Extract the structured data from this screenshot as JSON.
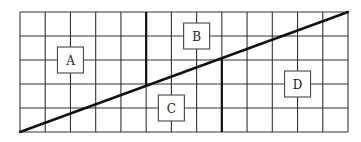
{
  "diagram": {
    "type": "grid-partition",
    "grid": {
      "columns": 13,
      "rows": 5,
      "left": 20,
      "top": 12,
      "right": 348,
      "bottom": 132
    },
    "diagonal": {
      "from": "bottom-left",
      "to": "top-right"
    },
    "thick_segments": [
      {
        "col_line": 5,
        "from": "top",
        "to": "diagonal"
      },
      {
        "col_line": 8,
        "from": "diagonal",
        "to": "bottom"
      }
    ],
    "regions": [
      {
        "id": "A",
        "label": "A",
        "col_line": 2,
        "row_line": 2
      },
      {
        "id": "B",
        "label": "B",
        "col_line": 7,
        "row_line": 1
      },
      {
        "id": "C",
        "label": "C",
        "col_line": 6,
        "row_line": 4
      },
      {
        "id": "D",
        "label": "D",
        "col_line": 11,
        "row_line": 3
      }
    ],
    "colors": {
      "line": "#333333",
      "background": "#ffffff"
    }
  }
}
